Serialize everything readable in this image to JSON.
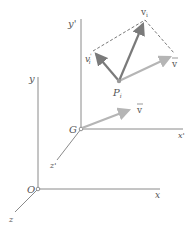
{
  "diagram": {
    "type": "rigid-body kinematics vector diagram",
    "labels": {
      "y_prime": "y'",
      "x_prime": "x'",
      "z_prime": "z'",
      "G": "G",
      "y": "y",
      "x": "x",
      "z": "z",
      "O": "O",
      "P_i": "P",
      "P_i_sub": "i",
      "v_i": "v",
      "v_i_sub": "i",
      "v_i_prime": "v",
      "v_i_prime_sub": "i",
      "v_i_prime_mark": "'",
      "v_bar_1": "v",
      "v_bar_2": "v"
    },
    "colors": {
      "axis": "#8a8a8a",
      "v_i": "#7a7a7a",
      "v_bar": "#b5b5b5",
      "dashed": "#555555"
    }
  }
}
